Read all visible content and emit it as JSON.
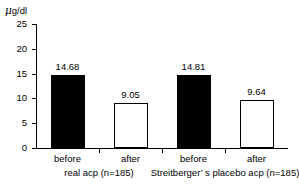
{
  "chart_data": {
    "type": "bar",
    "title": "",
    "xlabel": "",
    "ylabel": "μ g/dl",
    "ylim": [
      0,
      25
    ],
    "ytick_labels": [
      "25",
      "20",
      "15",
      "10",
      "5",
      "0"
    ],
    "ytick_values": [
      25,
      20,
      15,
      10,
      5,
      0
    ],
    "grid": false,
    "legend": "none",
    "categories": [
      "before",
      "after",
      "before",
      "after"
    ],
    "values": [
      14.68,
      9.05,
      14.81,
      9.64
    ],
    "value_labels": [
      "14.68",
      "9.05",
      "14.81",
      "9.64"
    ],
    "bar_styles": [
      "filled",
      "hollow",
      "filled",
      "hollow"
    ],
    "colors": {
      "filled": "#000000",
      "hollow": "#ffffff",
      "outline": "#000000",
      "axis": "#000000",
      "background": "#ffffff"
    },
    "groups": [
      {
        "label": "real acp  (n=185)",
        "n": 185,
        "members": [
          0,
          1
        ]
      },
      {
        "label": "Streitberger’ s  placebo acp  (n=185)",
        "n": 185,
        "members": [
          2,
          3
        ]
      }
    ]
  },
  "axis": {
    "unit_mu": "μ",
    "unit_rest": "g/dl"
  }
}
